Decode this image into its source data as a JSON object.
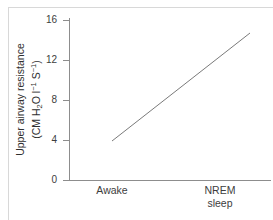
{
  "chart_data": {
    "type": "line",
    "title": "",
    "xlabel": "",
    "ylabel_line1": "Upper airway resistance",
    "ylabel_line2_prefix": "(CM H",
    "ylabel_line2_sub": "2",
    "ylabel_line2_mid": "O l",
    "ylabel_line2_sup1": "−1",
    "ylabel_line2_mid2": " S",
    "ylabel_line2_sup2": "−1",
    "ylabel_line2_suffix": ")",
    "ylabel_full": "Upper airway resistance (CM H2O l-1 S-1)",
    "categories": [
      "Awake",
      "NREM\nsleep"
    ],
    "x": [
      0,
      1
    ],
    "values": [
      3.9,
      14.7
    ],
    "series": [
      {
        "name": "Upper airway resistance",
        "values": [
          3.9,
          14.7
        ]
      }
    ],
    "yticks": [
      0,
      4,
      8,
      12,
      16
    ],
    "ytick_labels": [
      "0",
      "4",
      "8",
      "12",
      "16"
    ],
    "ylim": [
      0,
      17
    ],
    "grid": false,
    "legend": false,
    "legend_position": "none",
    "line_color": "#7a7a7a",
    "axis_color": "#8d8d8d",
    "text_color": "#3d3d3d",
    "background": "#ffffff"
  }
}
